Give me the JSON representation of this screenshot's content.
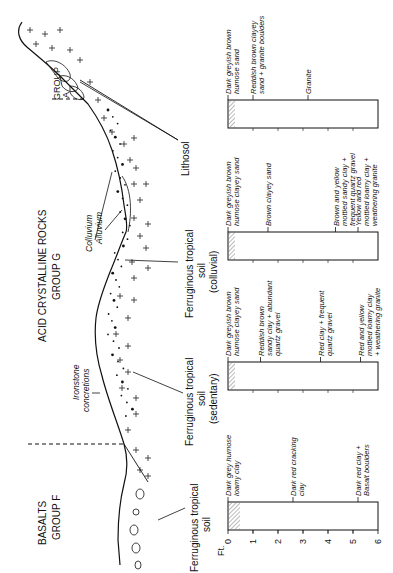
{
  "figure": {
    "region_labels": {
      "basalts_line1": "BASALTS",
      "basalts_line2": "GROUP F",
      "acid_line1": "ACID CRYSTALLINE ROCKS",
      "acid_line2": "GROUP G",
      "group_a_line1": "GROUP",
      "group_a_line2": "A"
    },
    "profile_labels": {
      "ironstone_line1": "Ironstone",
      "ironstone_line2": "concretions",
      "colluvium": "Colluvium",
      "alluvium": "Alluvium"
    },
    "soil_labels": [
      {
        "lines": [
          "Ferruginous tropical",
          "soil"
        ]
      },
      {
        "lines": [
          "Ferruginous tropical",
          "soil",
          "(sedentary)"
        ]
      },
      {
        "lines": [
          "Ferruginous tropical",
          "soil",
          "(colluvial)"
        ]
      },
      {
        "lines": [
          "Lithosol"
        ]
      }
    ],
    "depth_scale": {
      "unit": "Ft.",
      "ticks": [
        "0",
        "1",
        "2",
        "3",
        "4",
        "5",
        "6"
      ]
    },
    "columns": [
      {
        "name": "Basalt profile",
        "horizons": [
          {
            "lines": [
              "Dark grey humose",
              "loamy clay"
            ]
          },
          {
            "lines": [
              "Dark red cracking",
              "clay"
            ]
          },
          {
            "lines": [
              "Dark red clay +",
              "Basalt boulders"
            ]
          }
        ]
      },
      {
        "name": "Sedentary profile",
        "horizons": [
          {
            "lines": [
              "Dark greyish brown",
              "humose clayey sand"
            ]
          },
          {
            "lines": [
              "Reddish brown",
              "sandy clay + abundant",
              "quartz gravel"
            ]
          },
          {
            "lines": [
              "Red clay + frequent",
              "quartz gravel"
            ]
          },
          {
            "lines": [
              "Red and yellow",
              "mottled loamy clay",
              "+ weathering granite"
            ]
          }
        ]
      },
      {
        "name": "Colluvial profile",
        "horizons": [
          {
            "lines": [
              "Dark greyish brown",
              "humose clayey sand"
            ]
          },
          {
            "lines": [
              "Brown clayey sand"
            ]
          },
          {
            "lines": [
              "Brown and yellow",
              "mottled sandy clay +",
              "frequent quartz gravel"
            ]
          },
          {
            "lines": [
              "Yellow and red",
              "mottled loamy clay +",
              "weathering granite"
            ]
          }
        ]
      },
      {
        "name": "Lithosol profile",
        "horizons": [
          {
            "lines": [
              "Dark greyish brown",
              "humose sand"
            ]
          },
          {
            "lines": [
              "Reddish brown clayey",
              "sand + granite boulders"
            ]
          },
          {
            "lines": [
              "Granite"
            ]
          }
        ]
      }
    ],
    "colors": {
      "ink": "#111111",
      "hatch": "#888888",
      "background": "#ffffff"
    }
  }
}
